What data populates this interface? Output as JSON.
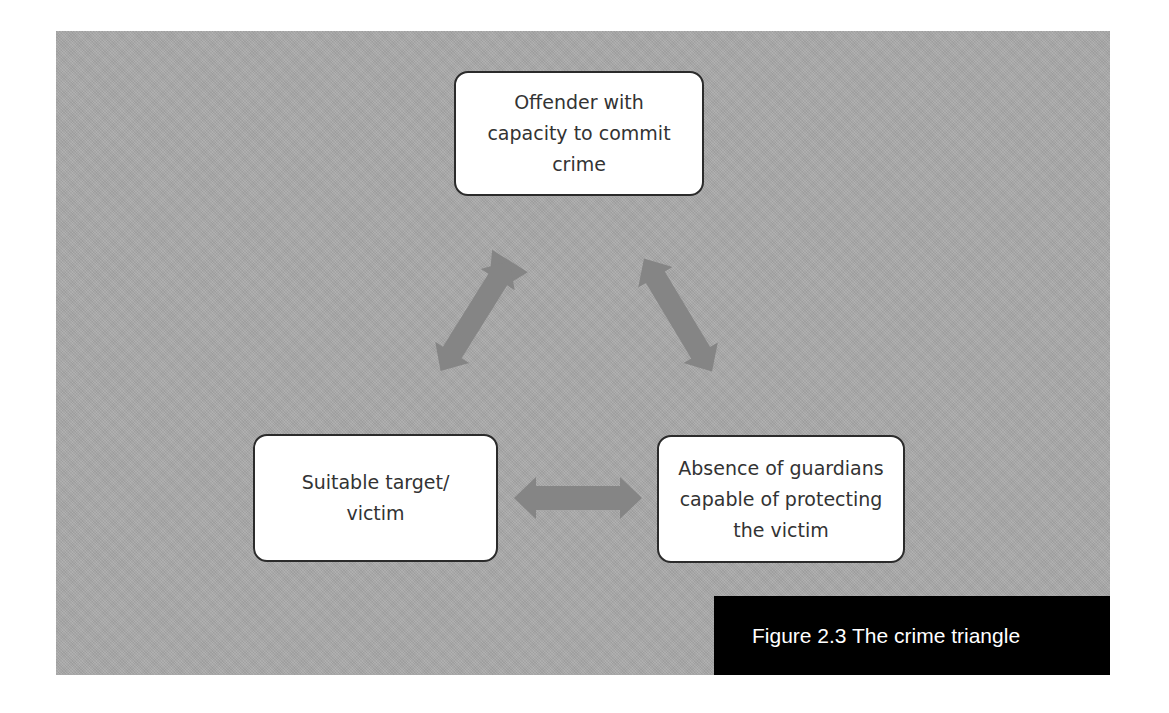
{
  "diagram": {
    "title": "The crime triangle",
    "nodes": [
      {
        "id": "offender",
        "label": "Offender with\ncapacity to commit\ncrime"
      },
      {
        "id": "target",
        "label": "Suitable target/\nvictim"
      },
      {
        "id": "guardian",
        "label": "Absence of guardians\ncapable of protecting\nthe victim"
      }
    ],
    "edges": [
      {
        "from": "offender",
        "to": "target",
        "type": "bidirectional-arrow"
      },
      {
        "from": "offender",
        "to": "guardian",
        "type": "bidirectional-arrow"
      },
      {
        "from": "target",
        "to": "guardian",
        "type": "bidirectional-arrow"
      }
    ],
    "colors": {
      "background": "#a9a9a9",
      "node_fill": "#ffffff",
      "node_border": "#2b2b2b",
      "arrow": "#858585",
      "caption_bg": "#000000",
      "caption_text": "#ffffff"
    }
  },
  "caption": {
    "text": "Figure 2.3 The crime triangle"
  }
}
